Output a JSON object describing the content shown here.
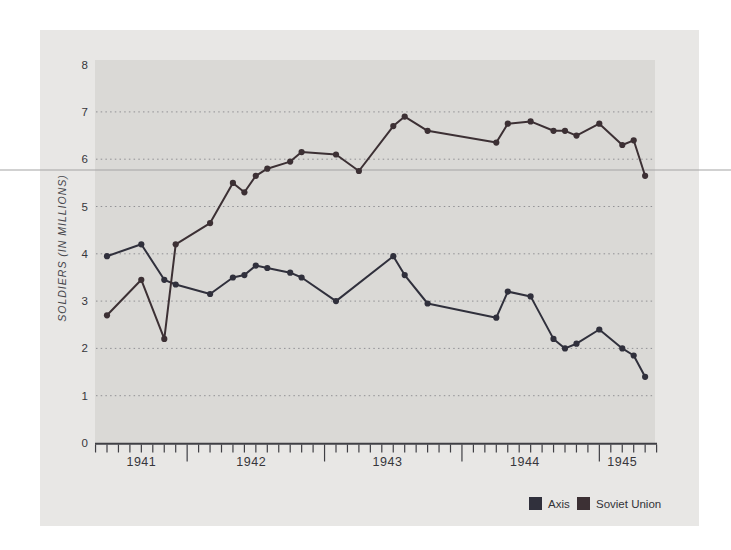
{
  "page": {
    "background_color": "#ffffff"
  },
  "card": {
    "background_color": "#e8e7e5"
  },
  "artifact": {
    "description": "horizontal scan line across full image",
    "color": "#a3a3a3",
    "y": 170
  },
  "chart_data": {
    "type": "line",
    "title": "",
    "xlabel": "",
    "ylabel": "SOLDIERS (IN MILLIONS)",
    "ylim": [
      0,
      8
    ],
    "yticks": [
      0,
      1,
      2,
      3,
      4,
      5,
      6,
      7,
      8
    ],
    "grid": "horizontal-dotted",
    "plot_background": "#dad9d6",
    "grid_color": "#85858a",
    "axis_color": "#3f3f44",
    "x_unit": "months, Jun 1941 - May 1945",
    "xtick_years": [
      "1941",
      "1942",
      "1943",
      "1944",
      "1945"
    ],
    "legend_position": "bottom-right",
    "series": [
      {
        "name": "Axis",
        "color": "#30303c",
        "points": [
          {
            "m": 0,
            "date": "Jun 1941",
            "value": 3.95
          },
          {
            "m": 3,
            "date": "Sep 1941",
            "value": 4.2
          },
          {
            "m": 5,
            "date": "Nov 1941",
            "value": 3.45
          },
          {
            "m": 6,
            "date": "Dec 1941",
            "value": 3.35
          },
          {
            "m": 9,
            "date": "Mar 1942",
            "value": 3.15
          },
          {
            "m": 11,
            "date": "May 1942",
            "value": 3.5
          },
          {
            "m": 12,
            "date": "Jun 1942",
            "value": 3.55
          },
          {
            "m": 13,
            "date": "Jul 1942",
            "value": 3.75
          },
          {
            "m": 14,
            "date": "Aug 1942",
            "value": 3.7
          },
          {
            "m": 16,
            "date": "Oct 1942",
            "value": 3.6
          },
          {
            "m": 17,
            "date": "Nov 1942",
            "value": 3.5
          },
          {
            "m": 20,
            "date": "Feb 1943",
            "value": 3.0
          },
          {
            "m": 25,
            "date": "Jul 1943",
            "value": 3.95
          },
          {
            "m": 26,
            "date": "Aug 1943",
            "value": 3.55
          },
          {
            "m": 28,
            "date": "Oct 1943",
            "value": 2.95
          },
          {
            "m": 34,
            "date": "Apr 1944",
            "value": 2.65
          },
          {
            "m": 35,
            "date": "May 1944",
            "value": 3.2
          },
          {
            "m": 37,
            "date": "Jul 1944",
            "value": 3.1
          },
          {
            "m": 39,
            "date": "Sep 1944",
            "value": 2.2
          },
          {
            "m": 40,
            "date": "Oct 1944",
            "value": 2.0
          },
          {
            "m": 41,
            "date": "Nov 1944",
            "value": 2.1
          },
          {
            "m": 43,
            "date": "Jan 1945",
            "value": 2.4
          },
          {
            "m": 45,
            "date": "Mar 1945",
            "value": 2.0
          },
          {
            "m": 46,
            "date": "Apr 1945",
            "value": 1.85
          },
          {
            "m": 47,
            "date": "May 1945",
            "value": 1.4
          }
        ]
      },
      {
        "name": "Soviet Union",
        "color": "#3c3034",
        "points": [
          {
            "m": 0,
            "date": "Jun 1941",
            "value": 2.7
          },
          {
            "m": 3,
            "date": "Sep 1941",
            "value": 3.45
          },
          {
            "m": 5,
            "date": "Nov 1941",
            "value": 2.2
          },
          {
            "m": 6,
            "date": "Dec 1941",
            "value": 4.2
          },
          {
            "m": 9,
            "date": "Mar 1942",
            "value": 4.65
          },
          {
            "m": 11,
            "date": "May 1942",
            "value": 5.5
          },
          {
            "m": 12,
            "date": "Jun 1942",
            "value": 5.3
          },
          {
            "m": 13,
            "date": "Jul 1942",
            "value": 5.65
          },
          {
            "m": 14,
            "date": "Aug 1942",
            "value": 5.8
          },
          {
            "m": 16,
            "date": "Oct 1942",
            "value": 5.95
          },
          {
            "m": 17,
            "date": "Nov 1942",
            "value": 6.15
          },
          {
            "m": 20,
            "date": "Feb 1943",
            "value": 6.1
          },
          {
            "m": 22,
            "date": "Apr 1943",
            "value": 5.75
          },
          {
            "m": 25,
            "date": "Jul 1943",
            "value": 6.7
          },
          {
            "m": 26,
            "date": "Aug 1943",
            "value": 6.9
          },
          {
            "m": 28,
            "date": "Oct 1943",
            "value": 6.6
          },
          {
            "m": 34,
            "date": "Apr 1944",
            "value": 6.35
          },
          {
            "m": 35,
            "date": "May 1944",
            "value": 6.75
          },
          {
            "m": 37,
            "date": "Jul 1944",
            "value": 6.8
          },
          {
            "m": 39,
            "date": "Sep 1944",
            "value": 6.6
          },
          {
            "m": 40,
            "date": "Oct 1944",
            "value": 6.6
          },
          {
            "m": 41,
            "date": "Nov 1944",
            "value": 6.5
          },
          {
            "m": 43,
            "date": "Jan 1945",
            "value": 6.75
          },
          {
            "m": 45,
            "date": "Mar 1945",
            "value": 6.3
          },
          {
            "m": 46,
            "date": "Apr 1945",
            "value": 6.4
          },
          {
            "m": 47,
            "date": "May 1945",
            "value": 5.65
          }
        ]
      }
    ]
  }
}
